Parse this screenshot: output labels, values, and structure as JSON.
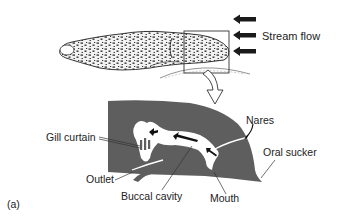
{
  "figure": {
    "panel_label": "(a)",
    "stream_label": "Stream flow",
    "labels": {
      "gill_curtain": "Gill curtain",
      "nares": "Nares",
      "oral_sucker": "Oral sucker",
      "outlet": "Outlet",
      "buccal_cavity": "Buccal cavity",
      "mouth": "Mouth"
    },
    "colors": {
      "section_fill": "#5e5e5e",
      "arrow": "#1a1a1a",
      "text": "#222222",
      "background": "#ffffff"
    }
  }
}
